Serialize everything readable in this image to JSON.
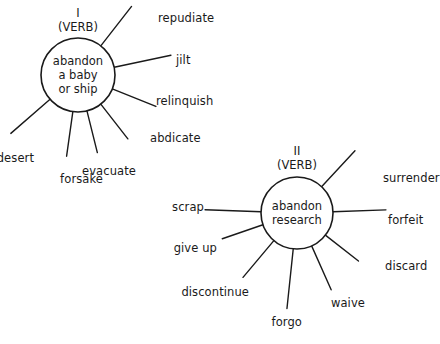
{
  "diagram": {
    "type": "semantic-network",
    "headword": "abandon",
    "background_color": "#ffffff",
    "line_color": "#1a1a1a",
    "senses": [
      {
        "numeral": "I",
        "part_of_speech": "(VERB)",
        "core_text": "abandon\na baby\nor ship",
        "center": {
          "x": 78,
          "y": 75
        },
        "radius": 37,
        "head_pos": {
          "x": 78,
          "y": 6
        },
        "synonyms": [
          {
            "label": "repudiate",
            "angle": -52,
            "label_x": 158,
            "label_y": 18,
            "line_len": 50,
            "anchor": "start"
          },
          {
            "label": "jilt",
            "angle": -12,
            "label_x": 176,
            "label_y": 60,
            "line_len": 58,
            "anchor": "start"
          },
          {
            "label": "relinquish",
            "angle": 22,
            "label_x": 156,
            "label_y": 101,
            "line_len": 47,
            "anchor": "start"
          },
          {
            "label": "abdicate",
            "angle": 52,
            "label_x": 150,
            "label_y": 138,
            "line_len": 44,
            "anchor": "start"
          },
          {
            "label": "evacuate",
            "angle": 76,
            "label_x": 136,
            "label_y": 171,
            "line_len": 43,
            "anchor": "end"
          },
          {
            "label": "forsake",
            "angle": 98,
            "label_x": 103,
            "label_y": 179,
            "line_len": 45,
            "anchor": "end"
          },
          {
            "label": "desert",
            "angle": 139,
            "label_x": 34,
            "label_y": 158,
            "line_len": 52,
            "anchor": "end"
          }
        ]
      },
      {
        "numeral": "II",
        "part_of_speech": "(VERB)",
        "core_text": "abandon\nresearch",
        "center": {
          "x": 297,
          "y": 213
        },
        "radius": 36,
        "head_pos": {
          "x": 297,
          "y": 144
        },
        "synonyms": [
          {
            "label": "surrender",
            "angle": -47,
            "label_x": 383,
            "label_y": 178,
            "line_len": 49,
            "anchor": "start"
          },
          {
            "label": "forfeit",
            "angle": -2,
            "label_x": 388,
            "label_y": 220,
            "line_len": 53,
            "anchor": "start"
          },
          {
            "label": "discard",
            "angle": 38,
            "label_x": 385,
            "label_y": 266,
            "line_len": 42,
            "anchor": "start"
          },
          {
            "label": "waive",
            "angle": 66,
            "label_x": 365,
            "label_y": 303,
            "line_len": 48,
            "anchor": "end"
          },
          {
            "label": "forgo",
            "angle": 96,
            "label_x": 302,
            "label_y": 322,
            "line_len": 60,
            "anchor": "end"
          },
          {
            "label": "discontinue",
            "angle": 130,
            "label_x": 249,
            "label_y": 292,
            "line_len": 48,
            "anchor": "end"
          },
          {
            "label": "give up",
            "angle": 161,
            "label_x": 217,
            "label_y": 248,
            "line_len": 43,
            "anchor": "end"
          },
          {
            "label": "scrap",
            "angle": 182,
            "label_x": 204,
            "label_y": 207,
            "line_len": 56,
            "anchor": "end"
          }
        ]
      }
    ]
  }
}
